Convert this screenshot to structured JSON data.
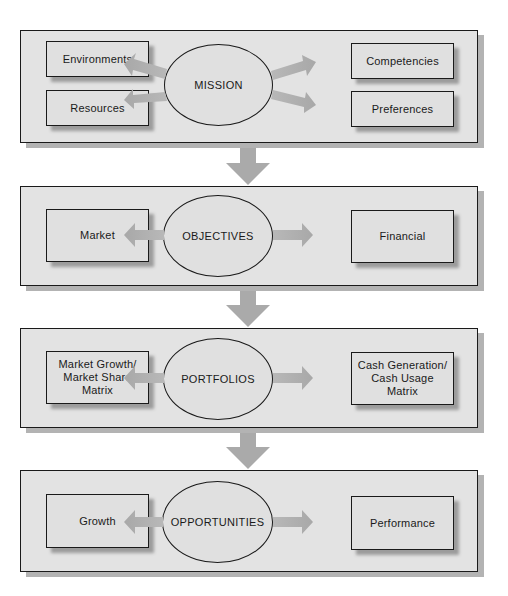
{
  "diagram": {
    "stages": [
      {
        "center": "MISSION",
        "left": [
          "Environments",
          "Resources"
        ],
        "right": [
          "Competencies",
          "Preferences"
        ]
      },
      {
        "center": "OBJECTIVES",
        "left": [
          "Market"
        ],
        "right": [
          "Financial"
        ]
      },
      {
        "center": "PORTFOLIOS",
        "left": [
          "Market Growth/ Market Share Matrix"
        ],
        "right": [
          "Cash Generation/ Cash Usage Matrix"
        ]
      },
      {
        "center": "OPPORTUNITIES",
        "left": [
          "Growth"
        ],
        "right": [
          "Performance"
        ]
      }
    ],
    "flow": [
      "MISSION",
      "OBJECTIVES",
      "PORTFOLIOS",
      "OPPORTUNITIES"
    ],
    "colors": {
      "panel_fill": "#e3e3e3",
      "outline": "#1a1a1a",
      "arrow": "#aaaaaa",
      "shadow": "#b3b3b3"
    }
  }
}
